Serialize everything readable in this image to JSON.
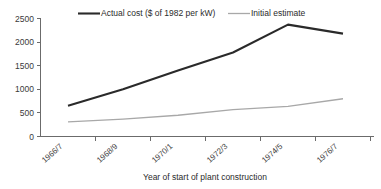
{
  "chart_data": {
    "type": "line",
    "title": "",
    "xlabel": "Year of start of plant construction",
    "ylabel": "",
    "categories": [
      "1966/7",
      "1968/9",
      "1970/1",
      "1972/3",
      "1974/5",
      "1976/7"
    ],
    "series": [
      {
        "name": "Actual cost ($ of 1982 per kW)",
        "color": "#2a2a2a",
        "values": [
          650,
          1000,
          1400,
          1780,
          2370,
          2180
        ]
      },
      {
        "name": "Initial estimate",
        "color": "#a8a8a8",
        "values": [
          310,
          370,
          450,
          570,
          640,
          800
        ]
      }
    ],
    "ylim": [
      0,
      2500
    ],
    "yticks": [
      0,
      500,
      1000,
      1500,
      2000,
      2500
    ],
    "ytick_labels": [
      "0",
      "500",
      "1000",
      "1500",
      "2000",
      "2500"
    ],
    "grid": false,
    "legend_position": "top"
  },
  "legend": {
    "items": [
      {
        "label": "Actual cost ($ of 1982 per kW)",
        "swatch": "line-swatch-dark"
      },
      {
        "label": "Initial estimate",
        "swatch": "line-swatch-gray"
      }
    ]
  },
  "axes": {
    "x_title": "Year of start of plant construction",
    "x_tick_labels": [
      "1966/7",
      "1968/9",
      "1970/1",
      "1972/3",
      "1974/5",
      "1976/7"
    ],
    "y_tick_labels": [
      "2500",
      "2000",
      "1500",
      "1000",
      "500",
      "0"
    ]
  }
}
